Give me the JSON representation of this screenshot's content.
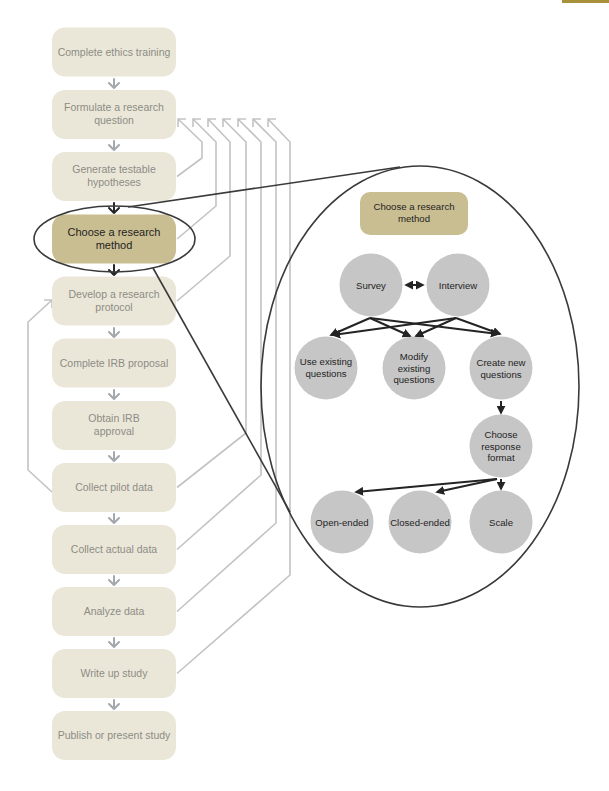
{
  "colors": {
    "step_fill": "#ebe7d8",
    "highlight_fill": "#c9bd92",
    "node_fill": "#c6c6c6",
    "feedback_line": "#c3c3c3",
    "corner_bar": "#a8913a"
  },
  "flow": {
    "steps": [
      {
        "lines": [
          "Complete ethics training"
        ]
      },
      {
        "lines": [
          "Formulate a research",
          "question"
        ]
      },
      {
        "lines": [
          "Generate testable",
          "hypotheses"
        ]
      },
      {
        "lines": [
          "Choose a research",
          "method"
        ],
        "highlighted": true
      },
      {
        "lines": [
          "Develop a research",
          "protocol"
        ]
      },
      {
        "lines": [
          "Complete IRB proposal"
        ]
      },
      {
        "lines": [
          "Obtain IRB",
          "approval"
        ]
      },
      {
        "lines": [
          "Collect pilot data"
        ]
      },
      {
        "lines": [
          "Collect actual data"
        ]
      },
      {
        "lines": [
          "Analyze data"
        ]
      },
      {
        "lines": [
          "Write up study"
        ]
      },
      {
        "lines": [
          "Publish or present study"
        ]
      }
    ],
    "feedback_loops_to": "Formulate a research question",
    "pilot_loop_to": "Develop a research protocol"
  },
  "detail": {
    "title_lines": [
      "Choose a research",
      "method"
    ],
    "nodes": {
      "survey": {
        "lines": [
          "Survey"
        ]
      },
      "interview": {
        "lines": [
          "Interview"
        ]
      },
      "use_existing": {
        "lines": [
          "Use existing",
          "questions"
        ]
      },
      "modify_existing": {
        "lines": [
          "Modify",
          "existing",
          "questions"
        ]
      },
      "create_new": {
        "lines": [
          "Create new",
          "questions"
        ]
      },
      "choose_format": {
        "lines": [
          "Choose",
          "response",
          "format"
        ]
      },
      "open_ended": {
        "lines": [
          "Open-ended"
        ]
      },
      "closed_ended": {
        "lines": [
          "Closed-ended"
        ]
      },
      "scale": {
        "lines": [
          "Scale"
        ]
      }
    }
  }
}
